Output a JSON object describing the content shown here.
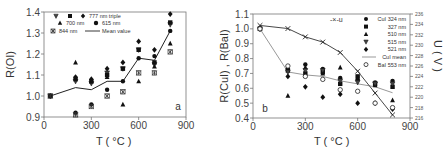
{
  "chart_data": [
    {
      "type": "scatter",
      "panel_label": "a",
      "title": "",
      "xlabel": "T (°C)",
      "ylabel": "R(OI)",
      "xlim": [
        0,
        900
      ],
      "ylim": [
        0.9,
        1.4
      ],
      "xticks": [
        0,
        300,
        600,
        900
      ],
      "yticks": [
        0.9,
        1.0,
        1.1,
        1.2,
        1.3,
        1.4
      ],
      "grid": false,
      "legend_position": "upper-left",
      "x": [
        40,
        200,
        300,
        400,
        500,
        600,
        700,
        800
      ],
      "series": [
        {
          "name": "777 nm triple (▽)",
          "marker": "triangle-down",
          "values": [
            1.0,
            1.07,
            1.06,
            1.11,
            1.13,
            1.22,
            1.15,
            1.34
          ]
        },
        {
          "name": "777 nm triple (■)",
          "marker": "square",
          "values": [
            1.0,
            1.08,
            1.07,
            1.1,
            1.13,
            1.22,
            1.16,
            1.35
          ]
        },
        {
          "name": "777 nm triple (◆)",
          "marker": "diamond",
          "values": [
            1.0,
            1.09,
            1.08,
            1.13,
            1.16,
            1.26,
            1.22,
            1.39
          ]
        },
        {
          "name": "700 nm",
          "marker": "triangle-up",
          "values": [
            1.0,
            1.16,
            1.07,
            1.09,
            0.96,
            1.07,
            1.14,
            1.25
          ]
        },
        {
          "name": "615 nm",
          "marker": "circle",
          "values": [
            1.0,
            0.92,
            0.96,
            1.03,
            1.07,
            1.18,
            1.19,
            1.31
          ]
        },
        {
          "name": "844 nm",
          "marker": "asterisk-box",
          "values": [
            1.0,
            0.91,
            0.95,
            1.0,
            1.02,
            1.11,
            1.11,
            1.21
          ]
        },
        {
          "name": "Mean value",
          "marker": "line",
          "values": [
            1.0,
            1.04,
            1.03,
            1.07,
            1.07,
            1.18,
            1.17,
            1.31
          ]
        }
      ]
    },
    {
      "type": "scatter",
      "panel_label": "b",
      "title": "",
      "xlabel": "T (°C)",
      "ylabel": "R(CuI) , R(BaI)",
      "ylabel_right": "U ( V )",
      "xlim": [
        0,
        900
      ],
      "ylim": [
        0.4,
        1.1
      ],
      "ylim_right": [
        216,
        236
      ],
      "xticks": [
        0,
        300,
        600,
        900
      ],
      "yticks": [
        0.4,
        0.5,
        0.6,
        0.7,
        0.8,
        0.9,
        1.0,
        1.1
      ],
      "yticks_right": [
        216,
        218,
        220,
        222,
        224,
        226,
        228,
        230,
        232,
        234,
        236
      ],
      "grid": false,
      "legend_position": "upper-right",
      "x": [
        40,
        200,
        300,
        400,
        500,
        600,
        700,
        800
      ],
      "series": [
        {
          "name": "CuI 324 nm",
          "marker": "circle",
          "values": [
            1.0,
            0.73,
            0.76,
            0.73,
            0.67,
            0.66,
            0.64,
            0.65
          ]
        },
        {
          "name": "327 nm",
          "marker": "square",
          "values": [
            1.0,
            0.72,
            0.7,
            0.71,
            0.63,
            0.68,
            0.63,
            0.61
          ]
        },
        {
          "name": "510 nm",
          "marker": "triangle-up",
          "values": [
            1.0,
            0.55,
            0.74,
            0.7,
            0.74,
            0.66,
            0.62,
            0.52
          ]
        },
        {
          "name": "515 nm",
          "marker": "triangle-down",
          "values": [
            1.0,
            0.71,
            0.72,
            0.72,
            0.65,
            0.64,
            0.63,
            0.63
          ]
        },
        {
          "name": "521 nm",
          "marker": "diamond",
          "values": [
            1.0,
            0.68,
            0.61,
            0.54,
            0.56,
            0.5,
            0.5,
            0.46
          ]
        },
        {
          "name": "CuI mean",
          "marker": "gray-line",
          "values": [
            1.0,
            0.71,
            0.69,
            0.68,
            0.65,
            0.63,
            0.61,
            0.57
          ]
        },
        {
          "name": "BaI 553 nm",
          "marker": "open-circle",
          "values": [
            1.0,
            0.75,
            0.68,
            0.66,
            0.59,
            0.58,
            0.5,
            0.47
          ]
        },
        {
          "name": "u",
          "axis": "right",
          "marker": "x-line",
          "values": [
            233.8,
            233.2,
            231.6,
            230.6,
            228.6,
            225.0,
            220.8,
            216.6
          ]
        }
      ]
    }
  ],
  "legend_a": {
    "row1": "777 nm triple",
    "row2a": "700 nm",
    "row2b": "615 nm",
    "row3a": "844 nm",
    "row3b": "Mean value"
  },
  "legend_b": {
    "u": "-×-u",
    "items": [
      "CuI 324 nm",
      "327 nm",
      "510 nm",
      "515 nm",
      "521 nm",
      "CuI mean",
      "BaI 553 nm"
    ]
  },
  "axes": {
    "a": {
      "xlabel": "T ( °C )",
      "ylabel": "R(OI)",
      "label": "a"
    },
    "b": {
      "xlabel": "T ( °C )",
      "ylabel": "R(CuI) , R(BaI)",
      "ylabel_right": "U ( V )",
      "label": "b"
    }
  }
}
